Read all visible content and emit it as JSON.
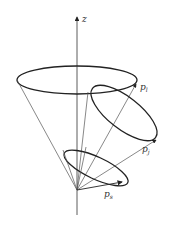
{
  "diagram": {
    "type": "nested-cones",
    "axis": {
      "label": "z"
    },
    "vectors": [
      {
        "name": "p",
        "subscript": "l"
      },
      {
        "name": "p",
        "subscript": "j"
      },
      {
        "name": "p",
        "subscript": "s"
      }
    ],
    "colors": {
      "stroke": "#222222",
      "thin": "#555555",
      "background": "#ffffff"
    }
  }
}
